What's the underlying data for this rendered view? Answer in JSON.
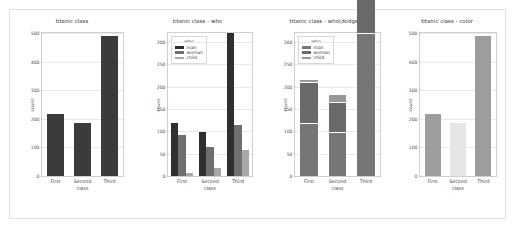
{
  "figure": {
    "background": "#ffffff",
    "border_color": "#e2e2e4"
  },
  "chart_data": [
    {
      "type": "bar",
      "title": "titanic class",
      "xlabel": "class",
      "ylabel": "count",
      "categories": [
        "First",
        "Second",
        "Third"
      ],
      "values": [
        216,
        184,
        491
      ],
      "ylim": [
        0,
        500
      ],
      "yticks": [
        0,
        100,
        200,
        300,
        400,
        500
      ],
      "grid": true,
      "legend": null,
      "bar_color": "#3b3b3b"
    },
    {
      "type": "bar",
      "title": "titanic class - who",
      "xlabel": "class",
      "ylabel": "count",
      "categories": [
        "First",
        "Second",
        "Third"
      ],
      "series": [
        {
          "name": "man",
          "values": [
            119,
            99,
            319
          ],
          "color": "#2f2f2f"
        },
        {
          "name": "woman",
          "values": [
            91,
            66,
            114
          ],
          "color": "#6f6f6f"
        },
        {
          "name": "child",
          "values": [
            6,
            19,
            58
          ],
          "color": "#a8a8a8"
        }
      ],
      "ylim": [
        0,
        320
      ],
      "yticks": [
        0,
        50,
        100,
        150,
        200,
        250,
        300
      ],
      "grid": true,
      "grouping": "grouped",
      "legend": {
        "title": "who",
        "entries": [
          "man",
          "woman",
          "child"
        ],
        "position": "upper left"
      }
    },
    {
      "type": "bar",
      "title": "titanic class - who(dodge)",
      "xlabel": "class",
      "ylabel": "count",
      "categories": [
        "First",
        "Second",
        "Third"
      ],
      "series": [
        {
          "name": "man",
          "values": [
            119,
            99,
            319
          ],
          "color": "#767676"
        },
        {
          "name": "woman",
          "values": [
            91,
            66,
            114
          ],
          "color": "#6a6a6a"
        },
        {
          "name": "child",
          "values": [
            6,
            19,
            58
          ],
          "color": "#989898"
        }
      ],
      "ylim": [
        0,
        320
      ],
      "yticks": [
        0,
        50,
        100,
        150,
        200,
        250,
        300
      ],
      "grid": true,
      "grouping": "stacked",
      "legend": {
        "title": "who",
        "entries": [
          "man",
          "woman",
          "child"
        ],
        "position": "upper left"
      }
    },
    {
      "type": "bar",
      "title": "titanic class - color",
      "xlabel": "class",
      "ylabel": "count",
      "categories": [
        "First",
        "Second",
        "Third"
      ],
      "values": [
        216,
        184,
        491
      ],
      "bar_colors": [
        "#9d9d9d",
        "#e6e6e6",
        "#9d9d9d"
      ],
      "ylim": [
        0,
        500
      ],
      "yticks": [
        0,
        100,
        200,
        300,
        400,
        500
      ],
      "grid": true,
      "legend": null
    }
  ]
}
